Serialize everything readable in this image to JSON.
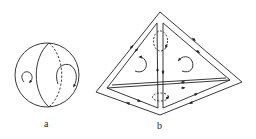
{
  "figure": {
    "panels": [
      {
        "id": "a",
        "label": "a",
        "description": "Sphere with a great-circle arc (solid front, dashed back) and two circular rotation arrows"
      },
      {
        "id": "b",
        "label": "b",
        "description": "Tetrahedral double-walled pyramid with directed edges, two curved rotation arrows on faces and two dashed circulation loops around the central vertical edge"
      }
    ],
    "colors": {
      "stroke": "#222222",
      "background": "#ffffff"
    }
  }
}
